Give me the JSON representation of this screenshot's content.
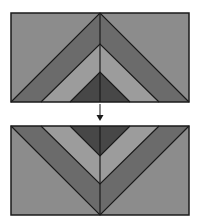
{
  "diagram": {
    "colors": {
      "background": "#ffffff",
      "outer": "#8c8c8c",
      "band_dark": "#6b6b6b",
      "band_light": "#9c9c9c",
      "core": "#474747",
      "stroke": "#1a1a1a"
    },
    "panels": [
      {
        "name": "original",
        "orientation": "up",
        "x": 11,
        "y": 13,
        "width": 178,
        "height": 89
      },
      {
        "name": "flipped",
        "orientation": "down",
        "x": 11,
        "y": 126,
        "width": 178,
        "height": 89
      }
    ],
    "arrow": {
      "direction": "down",
      "x": 100,
      "y1": 104,
      "y2": 121
    }
  }
}
